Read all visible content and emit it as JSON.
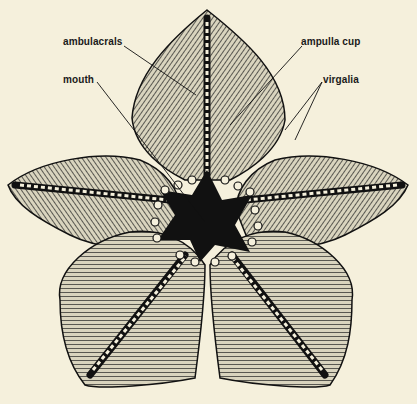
{
  "figure": {
    "background_color": "#f5f0dc",
    "ink_color": "#1a1a1a",
    "labels": [
      {
        "text": "ambulacrals",
        "x": 63,
        "y": 42
      },
      {
        "text": "ampulla cup",
        "x": 300,
        "y": 42
      },
      {
        "text": "mouth",
        "x": 63,
        "y": 78
      },
      {
        "text": "virgalia",
        "x": 323,
        "y": 78
      }
    ]
  }
}
